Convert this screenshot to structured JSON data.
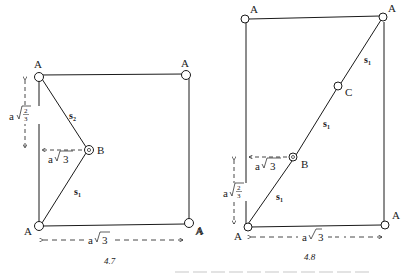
{
  "figures": [
    {
      "caption": "4.7",
      "atoms": {
        "A": "A",
        "B": "B"
      },
      "vectors": {
        "s1": "s",
        "s1_sub": "1",
        "s2": "s",
        "s2_sub": "2"
      },
      "dimensions": {
        "vertical": "a",
        "vertical_frac_num": "2",
        "vertical_frac_den": "3",
        "horizontal_B": "a",
        "horizontal_B_root": "3",
        "bottom": "a",
        "bottom_root": "3"
      }
    },
    {
      "caption": "4.8",
      "atoms": {
        "A": "A",
        "B": "B",
        "C": "C"
      },
      "vectors": {
        "s1": "s",
        "s1_sub": "1"
      },
      "dimensions": {
        "vertical": "a",
        "vertical_frac_num": "2",
        "vertical_frac_den": "3",
        "horizontal_B": "a",
        "horizontal_B_root": "3",
        "bottom": "a",
        "bottom_root": "3"
      }
    }
  ],
  "colors": {
    "line": "#1a1a1a",
    "background": "#ffffff"
  }
}
